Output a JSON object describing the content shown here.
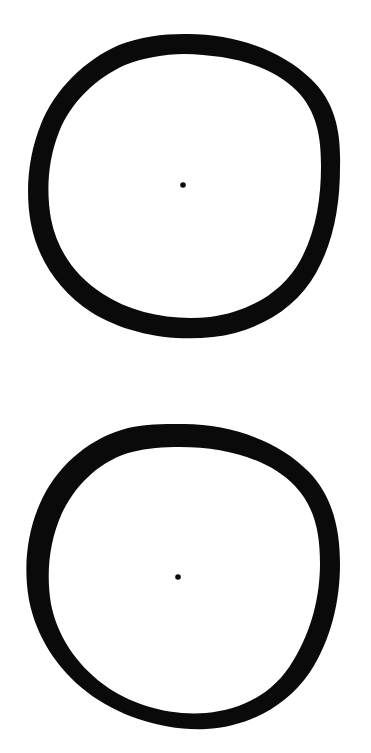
{
  "canvas": {
    "width": 371,
    "height": 753,
    "background_color": "#ffffff",
    "ink_color": "#0a0a0a",
    "title": "Two hand-drawn thick circles with center dots",
    "style": "hand-drawn ink on white paper, scanned"
  },
  "figures": [
    {
      "id": "circle-top",
      "label": "Top circle",
      "shape": "annulus",
      "center_x": 184,
      "center_y": 186,
      "radius_x": 156,
      "radius_y": 152,
      "stroke_width": 21,
      "bounds": {
        "left": 28,
        "top": 34,
        "right": 340,
        "bottom": 338
      },
      "fill_color": "#ffffff",
      "stroke_color": "#0a0a0a",
      "dot": {
        "id": "dot-top",
        "label": "Center dot of top circle",
        "center_x": 183,
        "center_y": 185,
        "radius": 2.8,
        "color": "#0a0a0a"
      }
    },
    {
      "id": "circle-bottom",
      "label": "Bottom circle",
      "shape": "annulus",
      "center_x": 183,
      "center_y": 577,
      "radius_x": 157,
      "radius_y": 153,
      "stroke_width": 23,
      "bounds": {
        "left": 26,
        "top": 424,
        "right": 340,
        "bottom": 730
      },
      "fill_color": "#ffffff",
      "stroke_color": "#0a0a0a",
      "dot": {
        "id": "dot-bottom",
        "label": "Center dot of bottom circle",
        "center_x": 178,
        "center_y": 577,
        "radius": 2.8,
        "color": "#0a0a0a"
      }
    }
  ],
  "chart_data": {
    "type": "scatter",
    "title": "Two hand-drawn thick circles with center dots",
    "xlabel": "",
    "ylabel": "",
    "xlim": [
      0,
      371
    ],
    "ylim": [
      0,
      753
    ],
    "grid": false,
    "legend": null,
    "series": [
      {
        "name": "Circle outlines",
        "marker": "ring",
        "values": [
          {
            "cx": 184,
            "cy": 186,
            "rx": 156,
            "ry": 152,
            "stroke": 21
          },
          {
            "cx": 183,
            "cy": 577,
            "rx": 157,
            "ry": 153,
            "stroke": 23
          }
        ]
      },
      {
        "name": "Center dots",
        "marker": "filled-dot",
        "values": [
          {
            "cx": 183,
            "cy": 185,
            "r": 2.8
          },
          {
            "cx": 178,
            "cy": 577,
            "r": 2.8
          }
        ]
      }
    ]
  }
}
